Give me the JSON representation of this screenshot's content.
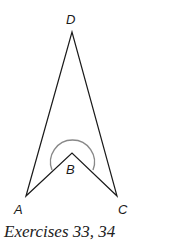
{
  "figure": {
    "points": {
      "A": {
        "label": "A",
        "x": 26,
        "y": 196
      },
      "B": {
        "label": "B",
        "x": 72,
        "y": 153
      },
      "C": {
        "label": "C",
        "x": 117,
        "y": 196
      },
      "D": {
        "label": "D",
        "x": 72,
        "y": 32
      }
    },
    "segments": [
      [
        "A",
        "D"
      ],
      [
        "D",
        "C"
      ],
      [
        "C",
        "B"
      ],
      [
        "B",
        "A"
      ]
    ],
    "marked_angle": {
      "vertex": "B",
      "type": "reflex",
      "color": "#888888"
    },
    "line_color": "#1a1a1a"
  },
  "caption": "Exercises 33, 34"
}
